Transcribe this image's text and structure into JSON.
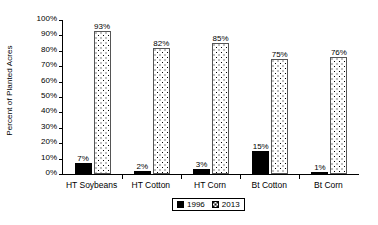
{
  "chart_data": {
    "type": "bar",
    "title": "",
    "subtitle": "",
    "xlabel": "",
    "ylabel": "Percent of Planted Acres",
    "ylim": [
      0,
      100
    ],
    "ytick_labels": [
      "100%",
      "90%",
      "80%",
      "70%",
      "60%",
      "50%",
      "40%",
      "30%",
      "20%",
      "10%",
      "0%"
    ],
    "ytick_values": [
      100,
      90,
      80,
      70,
      60,
      50,
      40,
      30,
      20,
      10,
      0
    ],
    "grid": false,
    "legend_position": "bottom-center",
    "categories": [
      "HT Soybeans",
      "HT Cotton",
      "HT Corn",
      "Bt Cotton",
      "Bt Corn"
    ],
    "series": [
      {
        "name": "1996",
        "color": "#000000",
        "pattern": "solid",
        "values": [
          7,
          2,
          3,
          15,
          1
        ],
        "data_labels": [
          "7%",
          "2%",
          "3%",
          "15%",
          "1%"
        ]
      },
      {
        "name": "2013",
        "color": "#ffffff",
        "pattern": "dotted",
        "values": [
          93,
          82,
          85,
          75,
          76
        ],
        "data_labels": [
          "93%",
          "82%",
          "85%",
          "75%",
          "76%"
        ]
      }
    ]
  },
  "legend": {
    "entries": [
      {
        "label": "1996",
        "swatch": "solid-black-square-icon"
      },
      {
        "label": "2013",
        "swatch": "dotted-square-icon"
      }
    ]
  },
  "axis": {
    "y_title": "Percent of Planted Acres"
  }
}
